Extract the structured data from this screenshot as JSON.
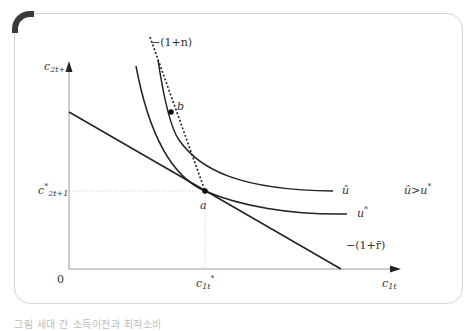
{
  "figure": {
    "axes": {
      "y_label": "c2t+1",
      "y_label_main": "c",
      "y_label_sub": "2t+1",
      "x_label_main": "c",
      "x_label_sub": "1t",
      "origin": "0"
    },
    "ticks": {
      "y_star_main": "c",
      "y_star_sup": "*",
      "y_star_sub": "2t+1",
      "x_star_main": "c",
      "x_star_sub": "1t",
      "x_star_sup": "*"
    },
    "lines": {
      "population_growth_slope": "−(1+n)",
      "interest_slope": "−(1+r̄)"
    },
    "curves": {
      "u_hat": "û",
      "u_star_main": "u",
      "u_star_sup": "*"
    },
    "points": {
      "a": "a",
      "b": "b"
    },
    "annotation": "û>u*",
    "annotation_left": "û",
    "annotation_op": ">",
    "annotation_right_main": "u",
    "annotation_right_sup": "*"
  },
  "caption": "그림    세대 간 소득이전과 최적소비"
}
